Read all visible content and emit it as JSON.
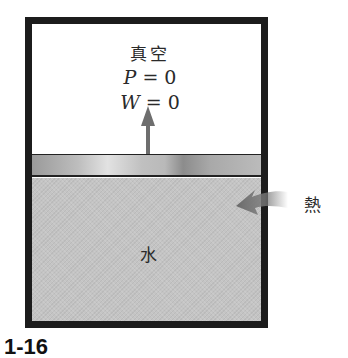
{
  "diagram": {
    "type": "piston-cylinder",
    "upper_region": {
      "label": "真空",
      "pressure": {
        "symbol": "P",
        "eq": " = 0"
      },
      "work": {
        "symbol": "W",
        "eq": " = 0"
      }
    },
    "lower_region": {
      "label": "水"
    },
    "heat": {
      "label": "熱",
      "direction": "into-cylinder"
    },
    "piston_motion": "up",
    "figure_number": "1-16"
  },
  "colors": {
    "wall": "#1c1c1c",
    "water": "#c4c4c4",
    "arrow": "#6e6e6e",
    "text": "#2a2a2a"
  }
}
